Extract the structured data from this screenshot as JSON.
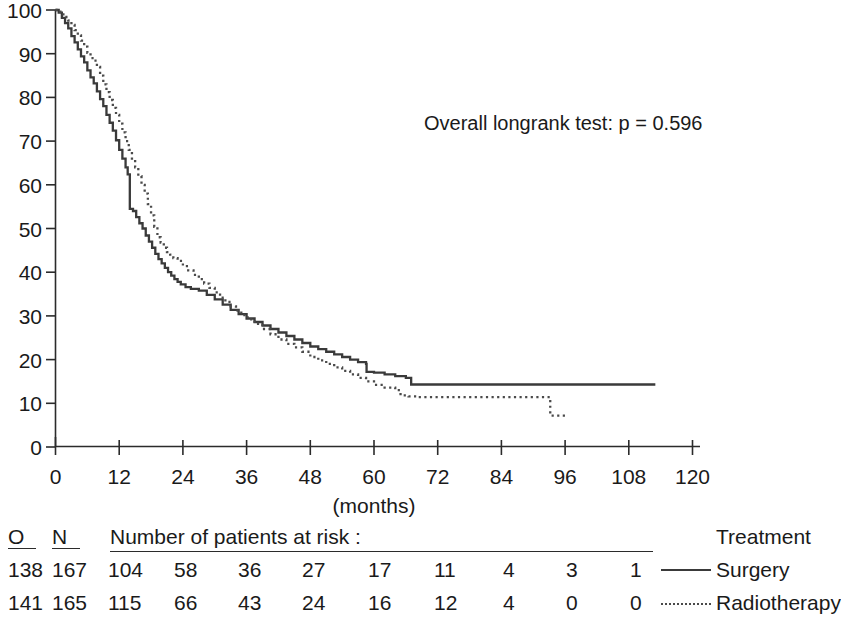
{
  "chart_data": {
    "type": "line",
    "title": "",
    "xlabel": "(months)",
    "ylabel": "",
    "xlim": [
      0,
      120
    ],
    "ylim": [
      0,
      100
    ],
    "grid": false,
    "xticks": [
      0,
      12,
      24,
      36,
      48,
      60,
      72,
      84,
      96,
      108,
      120
    ],
    "yticks": [
      0,
      10,
      20,
      30,
      40,
      50,
      60,
      70,
      80,
      90,
      100
    ],
    "xtick_labels": [
      "0",
      "12",
      "24",
      "36",
      "48",
      "60",
      "72",
      "84",
      "96",
      "108",
      "120"
    ],
    "ytick_labels": [
      "0",
      "10",
      "20",
      "30",
      "40",
      "50",
      "60",
      "70",
      "80",
      "90",
      "100"
    ],
    "annotation": "Overall longrank test: p = 0.596",
    "legend_position": "bottom-right",
    "series": [
      {
        "name": "Surgery",
        "style": "solid",
        "color": "#3a3a3a",
        "points": [
          [
            0,
            100
          ],
          [
            0.6,
            99.4
          ],
          [
            1.2,
            98.2
          ],
          [
            1.8,
            97.0
          ],
          [
            2.4,
            95.8
          ],
          [
            3.0,
            94.0
          ],
          [
            3.6,
            92.6
          ],
          [
            4.2,
            91.0
          ],
          [
            4.8,
            89.4
          ],
          [
            5.4,
            88.0
          ],
          [
            6.0,
            86.2
          ],
          [
            6.6,
            84.6
          ],
          [
            7.2,
            83.2
          ],
          [
            7.8,
            81.4
          ],
          [
            8.4,
            79.6
          ],
          [
            9.0,
            78.0
          ],
          [
            9.6,
            76.0
          ],
          [
            10.2,
            74.2
          ],
          [
            10.8,
            72.4
          ],
          [
            11.4,
            70.2
          ],
          [
            12.0,
            68.0
          ],
          [
            12.6,
            66.0
          ],
          [
            13.2,
            64.0
          ],
          [
            13.6,
            62.4
          ],
          [
            14.0,
            54.5
          ],
          [
            14.6,
            54.0
          ],
          [
            15.2,
            52.6
          ],
          [
            15.8,
            51.2
          ],
          [
            16.4,
            50.0
          ],
          [
            17.0,
            48.4
          ],
          [
            17.6,
            47.0
          ],
          [
            18.2,
            45.6
          ],
          [
            18.8,
            44.2
          ],
          [
            19.4,
            43.0
          ],
          [
            20.0,
            42.0
          ],
          [
            20.6,
            41.0
          ],
          [
            21.2,
            40.0
          ],
          [
            21.8,
            39.2
          ],
          [
            22.4,
            38.4
          ],
          [
            23.0,
            37.8
          ],
          [
            23.6,
            37.2
          ],
          [
            24.5,
            36.6
          ],
          [
            25.5,
            36.2
          ],
          [
            27.0,
            35.8
          ],
          [
            28.5,
            34.8
          ],
          [
            30.0,
            33.8
          ],
          [
            31.5,
            32.6
          ],
          [
            33.0,
            31.4
          ],
          [
            34.5,
            30.4
          ],
          [
            36.0,
            29.4
          ],
          [
            37.5,
            28.6
          ],
          [
            39.0,
            27.8
          ],
          [
            40.5,
            27.0
          ],
          [
            42.0,
            26.2
          ],
          [
            43.5,
            25.4
          ],
          [
            45.0,
            24.6
          ],
          [
            46.5,
            23.8
          ],
          [
            48.0,
            23.0
          ],
          [
            49.5,
            22.4
          ],
          [
            51.0,
            21.8
          ],
          [
            52.5,
            21.2
          ],
          [
            54.0,
            20.6
          ],
          [
            55.5,
            20.0
          ],
          [
            57.0,
            19.4
          ],
          [
            58.5,
            19.0
          ],
          [
            58.6,
            17.2
          ],
          [
            60.0,
            17.0
          ],
          [
            62.0,
            16.6
          ],
          [
            64.0,
            16.2
          ],
          [
            66.0,
            15.8
          ],
          [
            67.0,
            14.3
          ],
          [
            113.0,
            14.3
          ]
        ]
      },
      {
        "name": "Radiotherapy",
        "style": "dotted",
        "color": "#4a4a4a",
        "points": [
          [
            0,
            100
          ],
          [
            0.6,
            99.6
          ],
          [
            1.2,
            99.0
          ],
          [
            1.8,
            98.4
          ],
          [
            2.4,
            97.6
          ],
          [
            3.0,
            96.6
          ],
          [
            3.6,
            95.4
          ],
          [
            4.2,
            94.2
          ],
          [
            4.8,
            93.0
          ],
          [
            5.4,
            91.6
          ],
          [
            6.0,
            90.2
          ],
          [
            6.6,
            89.0
          ],
          [
            7.2,
            88.4
          ],
          [
            7.8,
            87.0
          ],
          [
            8.4,
            85.0
          ],
          [
            9.0,
            83.0
          ],
          [
            9.6,
            81.2
          ],
          [
            10.2,
            79.4
          ],
          [
            10.8,
            77.6
          ],
          [
            11.4,
            76.0
          ],
          [
            12.0,
            74.0
          ],
          [
            12.6,
            72.0
          ],
          [
            13.2,
            70.0
          ],
          [
            13.8,
            68.0
          ],
          [
            14.4,
            66.0
          ],
          [
            15.0,
            64.0
          ],
          [
            15.6,
            62.0
          ],
          [
            16.2,
            60.0
          ],
          [
            16.8,
            58.0
          ],
          [
            17.4,
            55.6
          ],
          [
            18.0,
            53.0
          ],
          [
            18.6,
            50.4
          ],
          [
            19.2,
            48.0
          ],
          [
            19.8,
            46.8
          ],
          [
            20.4,
            45.6
          ],
          [
            21.0,
            44.6
          ],
          [
            21.6,
            44.0
          ],
          [
            22.2,
            43.2
          ],
          [
            23.0,
            42.6
          ],
          [
            24.0,
            41.4
          ],
          [
            25.0,
            40.4
          ],
          [
            26.0,
            39.4
          ],
          [
            27.0,
            38.4
          ],
          [
            28.0,
            37.4
          ],
          [
            29.0,
            36.4
          ],
          [
            30.0,
            35.4
          ],
          [
            31.0,
            34.2
          ],
          [
            32.0,
            33.2
          ],
          [
            33.0,
            32.2
          ],
          [
            34.0,
            31.2
          ],
          [
            35.0,
            30.2
          ],
          [
            36.2,
            29.2
          ],
          [
            37.5,
            28.2
          ],
          [
            39.0,
            27.0
          ],
          [
            40.5,
            25.8
          ],
          [
            42.0,
            24.6
          ],
          [
            43.5,
            23.6
          ],
          [
            45.0,
            22.8
          ],
          [
            46.5,
            21.8
          ],
          [
            48.0,
            20.6
          ],
          [
            49.5,
            19.8
          ],
          [
            51.0,
            19.0
          ],
          [
            52.5,
            18.2
          ],
          [
            54.0,
            17.4
          ],
          [
            55.5,
            16.6
          ],
          [
            57.0,
            15.8
          ],
          [
            58.5,
            15.0
          ],
          [
            60.0,
            14.2
          ],
          [
            62.0,
            13.6
          ],
          [
            64.0,
            13.0
          ],
          [
            65.0,
            11.8
          ],
          [
            66.5,
            11.6
          ],
          [
            68.0,
            11.4
          ],
          [
            93.0,
            11.4
          ],
          [
            93.2,
            7.2
          ],
          [
            96.0,
            7.2
          ]
        ]
      }
    ]
  },
  "risk_table": {
    "header": {
      "o": "O",
      "n": "N",
      "title": "Number of patients at risk :",
      "treatment": "Treatment"
    },
    "rows": [
      {
        "o": "138",
        "n": "167",
        "style": "solid",
        "treatment": "Surgery",
        "counts": [
          "104",
          "58",
          "36",
          "27",
          "17",
          "11",
          "4",
          "3",
          "1"
        ]
      },
      {
        "o": "141",
        "n": "165",
        "style": "dotted",
        "treatment": "Radiotherapy",
        "counts": [
          "115",
          "66",
          "43",
          "24",
          "16",
          "12",
          "4",
          "0",
          "0"
        ]
      }
    ]
  }
}
